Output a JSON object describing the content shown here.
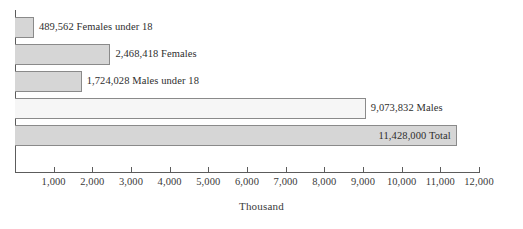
{
  "chart_data": {
    "type": "bar",
    "orientation": "horizontal",
    "title": "",
    "xlabel": "Thousand",
    "ylabel": "",
    "xlim": [
      0,
      12000
    ],
    "grid": false,
    "legend": null,
    "tick_labels": [
      "1,000",
      "2,000",
      "3,000",
      "4,000",
      "5,000",
      "6,000",
      "7,000",
      "8,000",
      "9,000",
      "10,000",
      "11,000",
      "12,000"
    ],
    "tick_values": [
      1000,
      2000,
      3000,
      4000,
      5000,
      6000,
      7000,
      8000,
      9000,
      10000,
      11000,
      12000
    ],
    "categories": [
      "Females under 18",
      "Females",
      "Males under 18",
      "Males",
      "Total"
    ],
    "values": [
      489.562,
      2468.418,
      1724.028,
      9073.832,
      11428.0
    ],
    "bars": [
      {
        "category": "Females under 18",
        "value": 489.562,
        "data_label": "489,562 Females under 18",
        "label_position": "outside",
        "fill": "#d6d6d6",
        "stroke": "#8a8a8a"
      },
      {
        "category": "Females",
        "value": 2468.418,
        "data_label": "2,468,418 Females",
        "label_position": "outside",
        "fill": "#d6d6d6",
        "stroke": "#8a8a8a"
      },
      {
        "category": "Males under 18",
        "value": 1724.028,
        "data_label": "1,724,028 Males under 18",
        "label_position": "outside",
        "fill": "#d6d6d6",
        "stroke": "#8a8a8a"
      },
      {
        "category": "Males",
        "value": 9073.832,
        "data_label": "9,073,832 Males",
        "label_position": "outside",
        "fill": "#f6f6f6",
        "stroke": "#8a8a8a"
      },
      {
        "category": "Total",
        "value": 11428.0,
        "data_label": "11,428,000 Total",
        "label_position": "inside",
        "fill": "#d6d6d6",
        "stroke": "#8a8a8a"
      }
    ],
    "colors": {
      "background": "#ffffff",
      "axis": "#5c5c5c",
      "text": "#2e2e2e",
      "bar_fill_gray": "#d6d6d6",
      "bar_fill_light": "#f6f6f6",
      "bar_stroke": "#8a8a8a"
    }
  }
}
